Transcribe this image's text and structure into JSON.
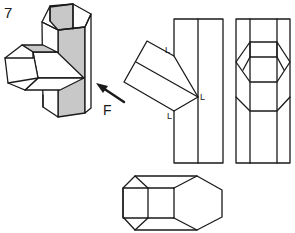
{
  "diagram": {
    "step_number": "7",
    "force_label": "F",
    "edge_labels": [
      "L",
      "L",
      "L"
    ],
    "colors": {
      "line": "#1a1a1a",
      "shade": "#c8c8c8",
      "background": "#ffffff"
    },
    "views": [
      {
        "name": "isometric-t-junction",
        "description": "3D hexagonal tube T-junction"
      },
      {
        "name": "front-view-with-branch",
        "description": "front view showing angled branch with fold points L"
      },
      {
        "name": "side-view",
        "description": "side view showing hexagonal opening"
      },
      {
        "name": "top-view",
        "description": "top view of elongated hexagonal prism"
      }
    ],
    "arrow": {
      "label": "F",
      "direction": "up-left"
    }
  }
}
